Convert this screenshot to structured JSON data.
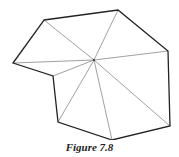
{
  "figure": {
    "caption": "Figure 7.8",
    "vertex_labels": [
      "top-left",
      "top-right",
      "right",
      "bottom-right",
      "bottom",
      "bottom-left",
      "inner-notch",
      "left"
    ],
    "interior_point": "center",
    "colors": {
      "edge": "#222222",
      "diagonal": "#777777",
      "background": "#ffffff"
    }
  }
}
